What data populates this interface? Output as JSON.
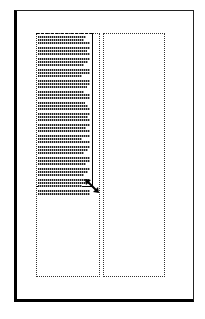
{
  "diagram": {
    "title": "",
    "page": {
      "columns": 2
    },
    "text_frame": {
      "line_widths": [
        48,
        46,
        52,
        52,
        49,
        52,
        52,
        50,
        46,
        52,
        52,
        44,
        52,
        52,
        49,
        46,
        52,
        52,
        47,
        50,
        52,
        52,
        50,
        52,
        52,
        48,
        52,
        52,
        44,
        52,
        52,
        50,
        46,
        52,
        52,
        48,
        52,
        50,
        46,
        52,
        52,
        44,
        52,
        52
      ]
    },
    "handle": {
      "icon": "diagonal-resize-icon"
    }
  }
}
